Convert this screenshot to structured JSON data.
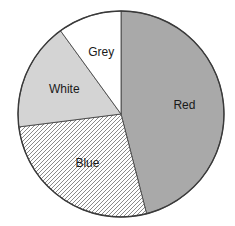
{
  "chart_data": {
    "type": "pie",
    "title": "",
    "start_angle_deg": 0,
    "direction": "clockwise",
    "categories": [
      "Red",
      "Blue",
      "White",
      "Grey"
    ],
    "values": [
      46,
      27,
      17,
      10
    ],
    "unit": "percent (estimated)",
    "slices": [
      {
        "label": "Red",
        "value": 46,
        "fill": "#a9a9a9",
        "pattern": "solid"
      },
      {
        "label": "Blue",
        "value": 27,
        "fill": "#ffffff",
        "pattern": "diagonal-hatch"
      },
      {
        "label": "White",
        "value": 17,
        "fill": "#d4d4d4",
        "pattern": "solid"
      },
      {
        "label": "Grey",
        "value": 10,
        "fill": "#ffffff",
        "pattern": "solid"
      }
    ],
    "legend": "none",
    "labels_inside_slices": true
  },
  "colors": {
    "outline": "#3a3a3a",
    "hatch_line": "#8a8a8a",
    "label_text": "#1a1a1a"
  }
}
